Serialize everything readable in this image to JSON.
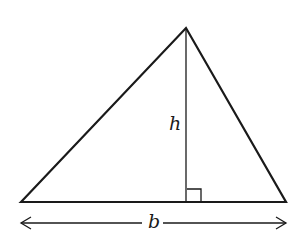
{
  "diagram": {
    "type": "triangle-area",
    "labels": {
      "height": "h",
      "base": "b"
    },
    "colors": {
      "stroke": "#1a1a1a",
      "background": "#ffffff"
    },
    "shapes": {
      "triangle": {
        "apex": [
          186,
          28
        ],
        "left": [
          21,
          202
        ],
        "right": [
          286,
          202
        ]
      },
      "altitude": {
        "from": [
          186,
          28
        ],
        "to": [
          186,
          202
        ]
      },
      "right_angle_marker": {
        "x": 187,
        "y": 189,
        "size": 14
      },
      "base_arrow": {
        "from": [
          20,
          223
        ],
        "to": [
          287,
          223
        ]
      }
    }
  }
}
